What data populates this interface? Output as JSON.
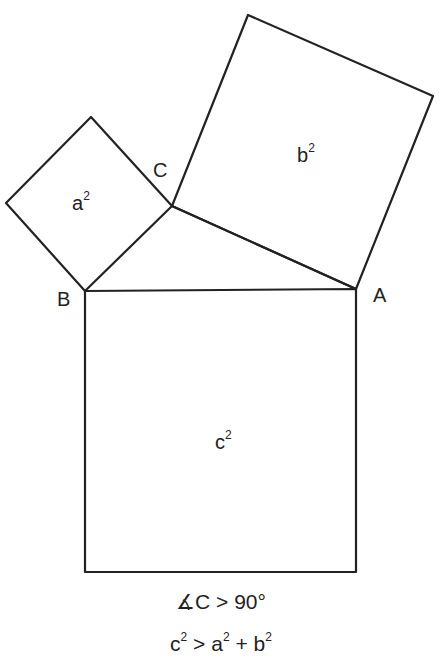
{
  "diagram": {
    "vertices": {
      "A": {
        "label": "A",
        "x": 356,
        "y": 289
      },
      "B": {
        "label": "B",
        "x": 85,
        "y": 291
      },
      "C": {
        "label": "C",
        "x": 172,
        "y": 206
      }
    },
    "squares": {
      "a": {
        "base": "a",
        "exp": "2"
      },
      "b": {
        "base": "b",
        "exp": "2"
      },
      "c": {
        "base": "c",
        "exp": "2"
      }
    },
    "caption": {
      "line1": "∡C > 90°",
      "line2": {
        "c": "c",
        "c_exp": "2",
        "gt": " > ",
        "a": "a",
        "a_exp": "2",
        "plus": " + ",
        "b": "b",
        "b_exp": "2"
      }
    },
    "stroke_color": "#222222"
  }
}
